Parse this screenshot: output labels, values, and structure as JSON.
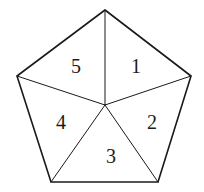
{
  "diagram": {
    "type": "pentagon-partition",
    "stroke_color": "#1a1a1a",
    "background": "#ffffff",
    "vertices": {
      "top": [
        105,
        10
      ],
      "right": [
        191,
        76
      ],
      "bottom_right": [
        158,
        182
      ],
      "bottom_left": [
        51,
        182
      ],
      "left": [
        17,
        76
      ]
    },
    "center": [
      105,
      105
    ],
    "regions": [
      {
        "id": "1",
        "label": "1",
        "position": [
          136,
          66
        ]
      },
      {
        "id": "2",
        "label": "2",
        "position": [
          152,
          122
        ]
      },
      {
        "id": "3",
        "label": "3",
        "position": [
          111,
          156
        ]
      },
      {
        "id": "4",
        "label": "4",
        "position": [
          61,
          122
        ]
      },
      {
        "id": "5",
        "label": "5",
        "position": [
          76,
          66
        ]
      }
    ]
  }
}
